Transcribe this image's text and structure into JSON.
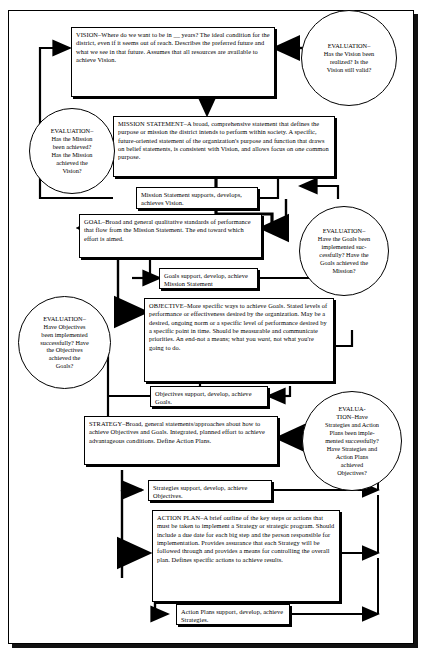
{
  "diagram": {
    "colors": {
      "line": "#000000",
      "background": "#ffffff",
      "box_fill": "#ffffff"
    },
    "nodes": {
      "vision": {
        "id": "vision",
        "label": "VISION",
        "text": "VISION–Where do we want to be in __ years? The ideal condition for the district, even if it seems out of reach. Describes the preferred future and what we see in that future. Assumes that all resources are available to achieve Vision."
      },
      "mission_statement": {
        "id": "mission-statement",
        "label": "MISSION STATEMENT",
        "text": "MISSION STATEMENT–A broad, comprehensive statement that defines the purpose or mission the district intends to perform within society. A specific, future-oriented statement of the organization's purpose and function that draws on belief statements, is consistent with Vision, and allows focus on one common purpose."
      },
      "mission_support": {
        "id": "mission-support",
        "text": "Mission Statement supports, develops, achieves Vision."
      },
      "goal": {
        "id": "goal",
        "label": "GOAL",
        "text": "GOAL–Broad and general qualitative standards of performance that flow from the Mission Statement. The end toward which effort is aimed."
      },
      "goals_support": {
        "id": "goals-support",
        "text": "Goals support, develop, achieve Mission Statement"
      },
      "objective": {
        "id": "objective",
        "label": "OBJECTIVE",
        "text_part1": "OBJECTIVE–More specific ways to achieve Goals. Stated levels of performance or effectiveness desired by the organization. May be a desired, ongoing norm or a specific level of performance desired by a specific point in time. Should be measurable and communicate priorities. An end-not a means; what you ",
        "text_italic": "want",
        "text_part2": ", not what you're going to do."
      },
      "objectives_support": {
        "id": "objectives-support",
        "text": "Objectives support, develop, achieve Goals."
      },
      "strategy": {
        "id": "strategy",
        "label": "STRATEGY",
        "text": "STRATEGY–Broad, general statements/approaches about how to achieve Objectives and Goals. Integrated, planned effort to achieve advantageous conditions. Define Action Plans."
      },
      "strategies_support": {
        "id": "strategies-support",
        "text": "Strategies support, develop, achieve Objectives."
      },
      "action_plan": {
        "id": "action-plan",
        "label": "ACTION PLAN",
        "text": "ACTION PLAN–A brief outline of the key steps or actions that must be taken to implement a Strategy or strategic program. Should include a due date for each big step and the person responsible for implementation. Provides assurance that each Strategy will be followed through and provides a means for controlling the overall plan. Defines specific actions to achieve results."
      },
      "action_plans_support": {
        "id": "action-plans-support",
        "text": "Action Plans support, develop, achieve Strategies."
      }
    },
    "evaluations": {
      "vision_eval": {
        "id": "evaluation-vision",
        "lines": [
          "EVALUATION–",
          "Has the Vision been",
          "realized?  Is the",
          "Vision still valid?"
        ]
      },
      "mission_eval": {
        "id": "evaluation-mission",
        "lines": [
          "EVALUATION–",
          "Has the Mission",
          "been achieved?",
          "Has the Mission",
          "achieved the",
          "Vision?"
        ]
      },
      "goals_eval": {
        "id": "evaluation-goals",
        "lines": [
          "EVALUATION–",
          "Have the Goals been",
          "implemented suc-",
          "cessfully?  Have the",
          "Goals achieved the",
          "Mission?"
        ]
      },
      "objectives_eval": {
        "id": "evaluation-objectives",
        "lines": [
          "EVALUATION–",
          "Have Objectives",
          "been implemented",
          "successfully?  Have",
          "the Objectives",
          "achieved the",
          "Goals?"
        ]
      },
      "strategies_eval": {
        "id": "evaluation-strategies",
        "lines": [
          "EVALUA-",
          "TION–Have",
          "Strategies and Action",
          "Plans been imple-",
          "mented successfully?",
          "Have Strategies and",
          "Action Plans",
          "achieved",
          "Objectives?"
        ]
      }
    }
  }
}
